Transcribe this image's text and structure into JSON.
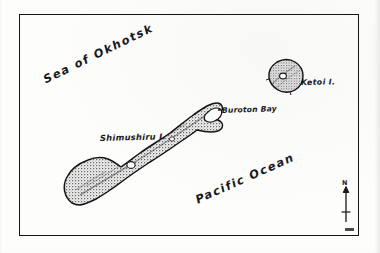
{
  "map": {
    "domain": "map",
    "medium": "scanned printed line map",
    "frame": {
      "stroke_color": "#151515"
    },
    "background_color": "#fdfdfc",
    "ink_color": "#1a1a1a",
    "land_fill_color": "#8d8d8d",
    "labels": {
      "sea_of_okhotsk": "Sea of Okhotsk",
      "pacific_ocean": "Pacific Ocean",
      "shimushiru_island": "Shimushiru I.",
      "buroton_bay": "Buroton Bay",
      "ketoi_island": "Ketoi I."
    },
    "north_arrow": {
      "letter": "N"
    },
    "features": [
      {
        "name": "Shimushiru I.",
        "type": "island",
        "orientation": "northeast-southwest elongated",
        "has_crater_lake": true
      },
      {
        "name": "Buroton Bay",
        "type": "bay",
        "location": "northeast end of Shimushiru I."
      },
      {
        "name": "Ketoi I.",
        "type": "island",
        "shape": "rounded, small",
        "has_crater_lake": true
      },
      {
        "name": "Sea of Okhotsk",
        "type": "sea",
        "location": "northwest of islands"
      },
      {
        "name": "Pacific Ocean",
        "type": "ocean",
        "location": "southeast of islands"
      }
    ]
  }
}
